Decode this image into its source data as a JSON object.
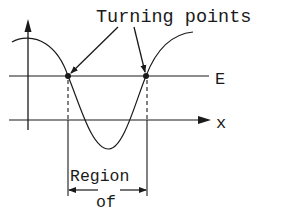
{
  "diagram": {
    "title_label": "Turning points",
    "energy_label": "E",
    "x_axis_label": "x",
    "region_label_line1": "Region",
    "region_label_line2": "of",
    "ink_color": "#1a1a1a",
    "background_color": "#ffffff"
  }
}
